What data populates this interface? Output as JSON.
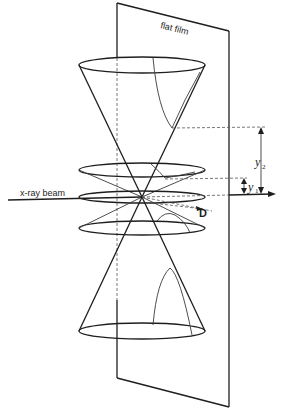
{
  "diagram": {
    "labels": {
      "film": "flat film",
      "beam": "x-ray beam",
      "distance": "D",
      "y2_symbol": "y",
      "y2_subscript": "2",
      "y1_symbol": "y",
      "y1_subscript": "1"
    },
    "elements": [
      "flat film plane",
      "x-ray beam axis",
      "outer diffraction cone (upper and lower)",
      "inner diffraction cone (upper and lower)",
      "central ring",
      "hyperbolic traces on film",
      "distance D to film",
      "measured distances y1 and y2"
    ],
    "colors": {
      "line": "#1e1e1e",
      "background": "#ffffff"
    }
  }
}
